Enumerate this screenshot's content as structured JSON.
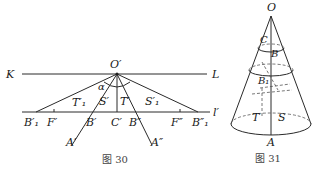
{
  "figure30": {
    "caption": "图 30",
    "labels": {
      "K": "K",
      "L": "L",
      "O": "O′",
      "l": "l′",
      "alpha": "α",
      "T1": "T′₁",
      "S": "S′",
      "T": "T′",
      "S1": "S′₁",
      "B1p": "B′₁",
      "Fp": "F′",
      "Bp": "B′",
      "Cp": "C′",
      "Bpp": "B″",
      "Fpp": "F″",
      "B1pp": "B″₁",
      "Ap": "A′",
      "App": "A″"
    }
  },
  "figure31": {
    "caption": "图 31",
    "labels": {
      "O": "O",
      "C": "C",
      "B": "B",
      "B1": "B₁",
      "T": "T",
      "S": "S",
      "A": "A"
    }
  }
}
